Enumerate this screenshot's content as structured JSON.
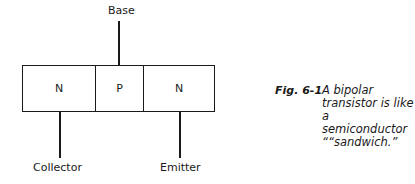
{
  "diagram": {
    "layers": [
      {
        "label": "N",
        "role": "collector region"
      },
      {
        "label": "P",
        "role": "base region"
      },
      {
        "label": "N",
        "role": "emitter region"
      }
    ],
    "terminals": {
      "base": "Base",
      "collector": "Collector",
      "emitter": "Emitter"
    }
  },
  "figure": {
    "number": "Fig. 6-1",
    "caption": "A bipolar transistor is like a semiconductor ““sandwich.”"
  }
}
